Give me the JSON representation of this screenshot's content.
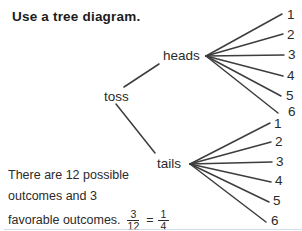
{
  "title": "Use a tree diagram.",
  "tree": {
    "root": "toss",
    "branches": [
      {
        "label": "heads",
        "outcomes": [
          "1",
          "2",
          "3",
          "4",
          "5",
          "6"
        ]
      },
      {
        "label": "tails",
        "outcomes": [
          "1",
          "2",
          "3",
          "4",
          "5",
          "6"
        ]
      }
    ]
  },
  "caption": {
    "line1": "There are 12 possible",
    "line2": "outcomes and 3",
    "line3": "favorable outcomes."
  },
  "equation": {
    "frac1": {
      "num": "3",
      "den": "12"
    },
    "equals": "=",
    "frac2": {
      "num": "1",
      "den": "4"
    }
  },
  "colors": {
    "text": "#222222",
    "line": "#3d3d3d",
    "background": "#ffffff"
  }
}
